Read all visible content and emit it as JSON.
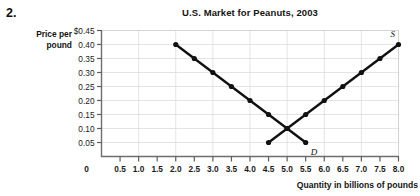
{
  "problem": {
    "number": "2."
  },
  "chart_title": "U.S. Market for Peanuts, 2003",
  "axes": {
    "y_label_line1": "Price per",
    "y_label_line2": "pound",
    "x_title": "Quantity in billions of pounds",
    "origin_label": "0"
  },
  "labels": {
    "supply": "S",
    "demand": "D"
  },
  "chart_data": {
    "type": "line",
    "title": "U.S. Market for Peanuts, 2003",
    "xlabel": "Quantity in billions of pounds",
    "ylabel": "Price per pound",
    "xlim": [
      0,
      8.0
    ],
    "ylim": [
      0,
      0.45
    ],
    "grid": true,
    "legend": "inline-curve-labels",
    "x_ticks": [
      0,
      0.5,
      1.0,
      1.5,
      2.0,
      2.5,
      3.0,
      3.5,
      4.0,
      4.5,
      5.0,
      5.5,
      6.0,
      6.5,
      7.0,
      7.5,
      8.0
    ],
    "x_tick_labels": [
      "0",
      "0.5",
      "1.0",
      "1.5",
      "2.0",
      "2.5",
      "3.0",
      "3.5",
      "4.0",
      "4.5",
      "5.0",
      "5.5",
      "6.0",
      "6.5",
      "7.0",
      "7.5",
      "8.0"
    ],
    "y_ticks": [
      0.05,
      0.1,
      0.15,
      0.2,
      0.25,
      0.3,
      0.35,
      0.4,
      0.45
    ],
    "y_tick_labels": [
      "0.05",
      "0.10",
      "0.15",
      "0.20",
      "0.25",
      "0.30",
      "0.35",
      "0.40",
      "$0.45"
    ],
    "series": [
      {
        "name": "D",
        "description": "Demand curve",
        "color": "#111111",
        "points": [
          {
            "x": 2.0,
            "y": 0.4
          },
          {
            "x": 2.5,
            "y": 0.35
          },
          {
            "x": 3.0,
            "y": 0.3
          },
          {
            "x": 3.5,
            "y": 0.25
          },
          {
            "x": 4.0,
            "y": 0.2
          },
          {
            "x": 4.5,
            "y": 0.15
          },
          {
            "x": 5.0,
            "y": 0.1
          },
          {
            "x": 5.5,
            "y": 0.05
          }
        ]
      },
      {
        "name": "S",
        "description": "Supply curve",
        "color": "#111111",
        "points": [
          {
            "x": 4.5,
            "y": 0.05
          },
          {
            "x": 5.0,
            "y": 0.1
          },
          {
            "x": 5.5,
            "y": 0.15
          },
          {
            "x": 6.0,
            "y": 0.2
          },
          {
            "x": 6.5,
            "y": 0.25
          },
          {
            "x": 7.0,
            "y": 0.3
          },
          {
            "x": 7.5,
            "y": 0.35
          },
          {
            "x": 8.0,
            "y": 0.4
          }
        ]
      }
    ],
    "equilibrium": {
      "x": 5.0,
      "y": 0.1
    }
  }
}
